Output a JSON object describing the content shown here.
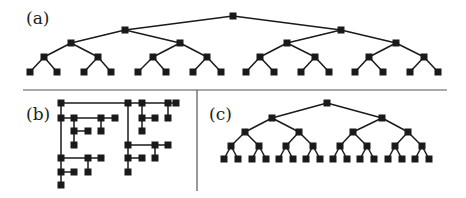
{
  "panels": {
    "a": {
      "label": "(a)"
    },
    "b": {
      "label": "(b)"
    },
    "c": {
      "label": "(c)"
    }
  },
  "style": {
    "ink": "#1a1a1a",
    "divider": "#555555",
    "node_size": 7
  },
  "tree_a": {
    "levels": [
      [
        233
      ],
      [
        125,
        341
      ],
      [
        71,
        180,
        287,
        396
      ],
      [
        44,
        98,
        153,
        207,
        260,
        315,
        369,
        424
      ],
      [
        30,
        57,
        84,
        111,
        138,
        166,
        193,
        221,
        246,
        274,
        301,
        329,
        355,
        383,
        410,
        438
      ]
    ],
    "ys": [
      16,
      30,
      43,
      57,
      72
    ]
  },
  "tree_c": {
    "levels": [
      [
        327
      ],
      [
        272,
        382
      ],
      [
        245,
        299,
        353,
        408
      ],
      [
        231,
        259,
        286,
        313,
        340,
        367,
        395,
        422
      ],
      [
        224,
        238,
        252,
        266,
        279,
        293,
        306,
        320,
        333,
        347,
        360,
        374,
        388,
        402,
        415,
        429
      ]
    ],
    "ys": [
      103,
      118,
      132,
      146,
      159
    ]
  },
  "tree_b": {
    "nodes": [
      [
        61,
        103
      ],
      [
        128,
        103
      ],
      [
        142,
        103
      ],
      [
        168,
        103
      ],
      [
        176,
        103
      ],
      [
        61,
        118
      ],
      [
        74,
        118
      ],
      [
        101,
        118
      ],
      [
        115,
        118
      ],
      [
        142,
        118
      ],
      [
        155,
        118
      ],
      [
        168,
        118
      ],
      [
        74,
        131
      ],
      [
        88,
        131
      ],
      [
        101,
        131
      ],
      [
        142,
        131
      ],
      [
        74,
        145
      ],
      [
        128,
        145
      ],
      [
        155,
        145
      ],
      [
        168,
        145
      ],
      [
        61,
        158
      ],
      [
        88,
        158
      ],
      [
        101,
        158
      ],
      [
        128,
        158
      ],
      [
        142,
        158
      ],
      [
        155,
        158
      ],
      [
        61,
        172
      ],
      [
        74,
        172
      ],
      [
        88,
        172
      ],
      [
        128,
        172
      ],
      [
        61,
        185
      ]
    ],
    "edges": [
      [
        [
          61,
          103
        ],
        [
          176,
          103
        ]
      ],
      [
        [
          61,
          103
        ],
        [
          61,
          185
        ]
      ],
      [
        [
          61,
          118
        ],
        [
          115,
          118
        ]
      ],
      [
        [
          74,
          118
        ],
        [
          74,
          145
        ]
      ],
      [
        [
          74,
          131
        ],
        [
          88,
          131
        ]
      ],
      [
        [
          101,
          118
        ],
        [
          101,
          131
        ]
      ],
      [
        [
          61,
          158
        ],
        [
          101,
          158
        ]
      ],
      [
        [
          88,
          158
        ],
        [
          88,
          172
        ]
      ],
      [
        [
          61,
          172
        ],
        [
          74,
          172
        ]
      ],
      [
        [
          128,
          103
        ],
        [
          128,
          172
        ]
      ],
      [
        [
          142,
          103
        ],
        [
          142,
          131
        ]
      ],
      [
        [
          142,
          118
        ],
        [
          155,
          118
        ]
      ],
      [
        [
          168,
          103
        ],
        [
          168,
          118
        ]
      ],
      [
        [
          128,
          145
        ],
        [
          168,
          145
        ]
      ],
      [
        [
          155,
          145
        ],
        [
          155,
          158
        ]
      ],
      [
        [
          128,
          158
        ],
        [
          142,
          158
        ]
      ]
    ]
  }
}
